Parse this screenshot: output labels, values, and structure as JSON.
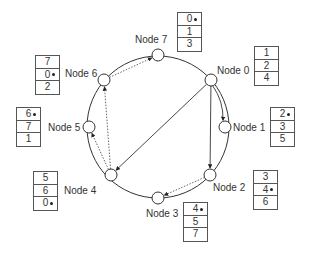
{
  "diagram": {
    "type": "chord-ring",
    "ring": {
      "cx": 158,
      "cy": 127,
      "r": 71
    },
    "nodes": [
      {
        "id": 0,
        "label": "Node 0",
        "x": 211,
        "y": 80,
        "label_x": 217,
        "label_y": 65,
        "table_x": 254,
        "table_y": 46,
        "entries": [
          "1",
          "2",
          "4"
        ],
        "marked_index": -1
      },
      {
        "id": 1,
        "label": "Node 1",
        "x": 225,
        "y": 127,
        "label_x": 233,
        "label_y": 122,
        "table_x": 270,
        "table_y": 107,
        "entries": [
          "2",
          "3",
          "5"
        ],
        "marked_index": 0
      },
      {
        "id": 2,
        "label": "Node 2",
        "x": 210,
        "y": 175,
        "label_x": 213,
        "label_y": 182,
        "table_x": 253,
        "table_y": 170,
        "entries": [
          "3",
          "4",
          "6"
        ],
        "marked_index": 1
      },
      {
        "id": 3,
        "label": "Node 3",
        "x": 158,
        "y": 198,
        "label_x": 146,
        "label_y": 208,
        "table_x": 183,
        "table_y": 202,
        "entries": [
          "4",
          "5",
          "7"
        ],
        "marked_index": 0
      },
      {
        "id": 4,
        "label": "Node 4",
        "x": 111,
        "y": 175,
        "label_x": 64,
        "label_y": 185,
        "table_x": 33,
        "table_y": 171,
        "entries": [
          "5",
          "6",
          "0"
        ],
        "marked_index": 2
      },
      {
        "id": 5,
        "label": "Node 5",
        "x": 89,
        "y": 127,
        "label_x": 48,
        "label_y": 122,
        "table_x": 16,
        "table_y": 107,
        "entries": [
          "6",
          "7",
          "1"
        ],
        "marked_index": 0
      },
      {
        "id": 6,
        "label": "Node 6",
        "x": 104,
        "y": 80,
        "label_x": 65,
        "label_y": 68,
        "table_x": 35,
        "table_y": 55,
        "entries": [
          "7",
          "0",
          "2"
        ],
        "marked_index": 1
      },
      {
        "id": 7,
        "label": "Node 7",
        "x": 158,
        "y": 55,
        "label_x": 135,
        "label_y": 34,
        "table_x": 177,
        "table_y": 12,
        "entries": [
          "0",
          "1",
          "3"
        ],
        "marked_index": 0
      }
    ],
    "edges": [
      {
        "from": 0,
        "to": 1,
        "style": "solid",
        "curved": true
      },
      {
        "from": 0,
        "to": 2,
        "style": "solid",
        "curved": false
      },
      {
        "from": 0,
        "to": 4,
        "style": "solid",
        "curved": false
      },
      {
        "from": 2,
        "to": 3,
        "style": "dotted",
        "curved": false
      },
      {
        "from": 4,
        "to": 5,
        "style": "dotted",
        "curved": false
      },
      {
        "from": 4,
        "to": 6,
        "style": "dotted",
        "curved": false
      },
      {
        "from": 6,
        "to": 7,
        "style": "dotted",
        "curved": false
      }
    ],
    "colors": {
      "line": "#333333",
      "dotted": "#555555",
      "node_fill": "#ffffff"
    }
  }
}
